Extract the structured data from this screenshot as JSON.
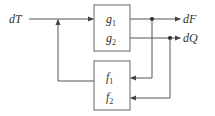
{
  "diagram": {
    "input": {
      "label": "dT"
    },
    "blocks": [
      {
        "id": "g",
        "rows": [
          {
            "base": "g",
            "sub": "1"
          },
          {
            "base": "g",
            "sub": "2"
          }
        ]
      },
      {
        "id": "f",
        "rows": [
          {
            "base": "f",
            "sub": "1"
          },
          {
            "base": "f",
            "sub": "2"
          }
        ]
      }
    ],
    "outputs": [
      {
        "label": "dF"
      },
      {
        "label": "dQ"
      }
    ],
    "colors": {
      "line": "#555555",
      "text": "#333333",
      "background": "#ffffff"
    }
  }
}
